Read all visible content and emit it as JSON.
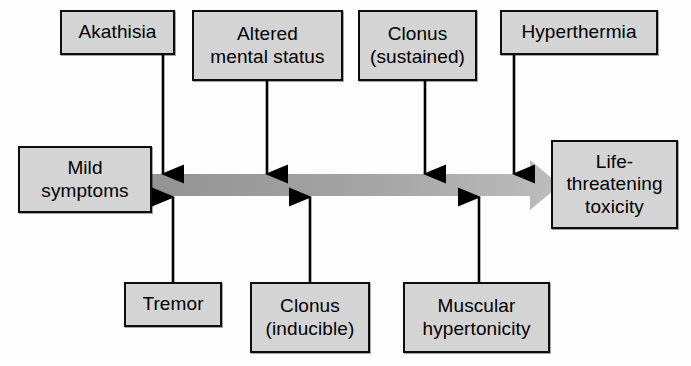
{
  "figure": {
    "background_color": "#fdfdfd",
    "box_fill": "#d4d4d4",
    "box_border": "#0d0d0d",
    "arrow_band_color_start": "#9a9a9a",
    "arrow_band_color_end": "#b8b8b8",
    "connector_color": "#000000"
  },
  "spectrum": {
    "start_label": "Mild\nsymptoms",
    "end_label": "Life-\nthreatening\ntoxicity",
    "direction": "left-to-right",
    "arrow_name": "severity-gradient-arrow"
  },
  "upper_findings": [
    {
      "label": "Akathisia",
      "connector": "down-arrow"
    },
    {
      "label": "Altered\nmental status",
      "connector": "down-arrow"
    },
    {
      "label": "Clonus\n(sustained)",
      "connector": "down-arrow"
    },
    {
      "label": "Hyperthermia",
      "connector": "down-arrow"
    }
  ],
  "lower_findings": [
    {
      "label": "Tremor",
      "connector": "up-arrow"
    },
    {
      "label": "Clonus\n(inducible)",
      "connector": "up-arrow"
    },
    {
      "label": "Muscular\nhypertonicity",
      "connector": "up-arrow"
    }
  ]
}
